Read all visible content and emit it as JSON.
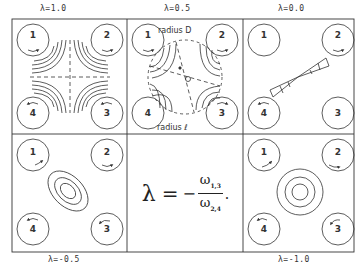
{
  "figure": {
    "panels": [
      {
        "id": "p1",
        "lambda_label": "λ=1.0",
        "pattern": "hyperbolic-saddle"
      },
      {
        "id": "p2",
        "lambda_label": "λ=0.5",
        "pattern": "saddle-with-circle",
        "annotations": [
          "radius D",
          "radius ℓ"
        ]
      },
      {
        "id": "p3",
        "lambda_label": "λ=0.0",
        "pattern": "bowtie-shear"
      },
      {
        "id": "p4",
        "lambda_label": "λ=-0.5",
        "pattern": "elliptic"
      },
      {
        "id": "p5",
        "pattern": "formula"
      },
      {
        "id": "p6",
        "lambda_label": "λ=-1.0",
        "pattern": "circular"
      }
    ],
    "roller_numbers": [
      "1",
      "2",
      "3",
      "4"
    ],
    "formula": {
      "lhs": "λ",
      "eq": "=",
      "minus": "−",
      "num_symbol": "ω",
      "num_sub": "1,3",
      "den_symbol": "ω",
      "den_sub": "2,4",
      "end": "."
    },
    "line_color": "#333333"
  }
}
